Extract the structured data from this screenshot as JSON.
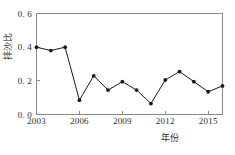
{
  "chart_data": {
    "type": "line",
    "title": "",
    "xlabel": "年份",
    "ylabel": "排沙比",
    "x": [
      2003,
      2004,
      2005,
      2006,
      2007,
      2008,
      2009,
      2010,
      2011,
      2012,
      2013,
      2014,
      2015,
      2016
    ],
    "values": [
      0.4,
      0.38,
      0.4,
      0.085,
      0.23,
      0.145,
      0.195,
      0.145,
      0.065,
      0.205,
      0.255,
      0.195,
      0.135,
      0.17
    ],
    "series": [
      {
        "name": "排沙比",
        "values": [
          0.4,
          0.38,
          0.4,
          0.085,
          0.23,
          0.145,
          0.195,
          0.145,
          0.065,
          0.205,
          0.255,
          0.195,
          0.135,
          0.17
        ]
      }
    ],
    "xlim": [
      2003,
      2016
    ],
    "ylim": [
      0.0,
      0.6
    ],
    "xticks": [
      2003,
      2006,
      2009,
      2012,
      2015
    ],
    "xtick_labels": [
      "2003",
      "2006",
      "2009",
      "2012",
      "2015"
    ],
    "yticks": [
      0.0,
      0.2,
      0.4,
      0.6
    ],
    "ytick_labels": [
      "0. 0",
      "0. 2",
      "0. 4",
      "0. 6"
    ],
    "grid": false,
    "legend": null,
    "legend_position": "none",
    "marker": "filled-circle",
    "line_color": "#1a1a1a",
    "marker_color": "#1a1a1a",
    "axis_color": "#8a8a8a",
    "background_color": "#ffffff"
  }
}
